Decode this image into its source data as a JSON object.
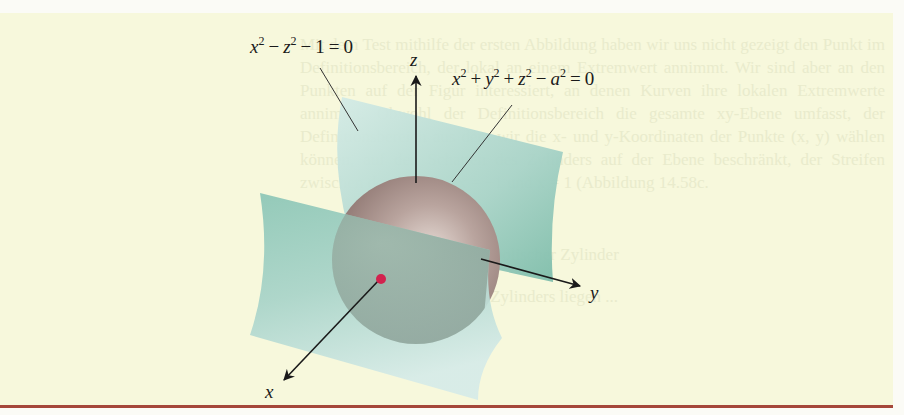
{
  "figure": {
    "equations": {
      "hyperbolic_cylinder": {
        "parts": [
          "x",
          "2",
          "−",
          "z",
          "2",
          "−",
          "1",
          "=",
          "0"
        ],
        "text": "x² − z² − 1 = 0"
      },
      "sphere": {
        "parts": [
          "x",
          "2",
          "+",
          "y",
          "2",
          "+",
          "z",
          "2",
          "−",
          "a",
          "2",
          "=",
          "0"
        ],
        "text": "x² + y² + z² − a² = 0"
      }
    },
    "axes": {
      "x": "x",
      "y": "y",
      "z": "z"
    },
    "colors": {
      "background": "#f7f8dc",
      "page": "#fbfbf6",
      "surface_light": "#cfe6e0",
      "surface_dark": "#7fbfae",
      "sphere": "#a8928c",
      "point": "#d2224e",
      "rule": "#a5473a",
      "ink": "#1a1a1a"
    },
    "background_text": {
      "paragraph": "Mit dem Test mithilfe der ersten Abbildung haben wir uns nicht gezeigt den Punkt im Definitionsbereich, der lokal an einem Extremwert annimmt. Wir sind aber an den Punkten auf der Figur interessiert, an denen Kurven ihre lokalen Extremwerte annimmt. Obwohl der Definitionsbereich die gesamte xy-Ebene umfasst, der Definitionsbereich aus dem wir die x- und y-Koordinaten der Punkte (x, y) wählen können, auf den Schatten des Zylinders auf der Ebene beschränkt, der Streifen zwischen den Geraden x = −1 und x = 1 (Abbildung 14.58c.",
      "line2": "hyperbolischer Zylinder",
      "line3": "Auf diesem Teil des Zylinders liegen ..."
    }
  }
}
